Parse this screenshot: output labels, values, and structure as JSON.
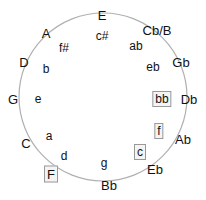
{
  "diagram": {
    "circle": {
      "cx": 103,
      "cy": 97,
      "r": 84,
      "stroke": "#b0b0b0"
    },
    "major_keys": [
      {
        "label": "E",
        "x": 102,
        "y": 15,
        "boxed": false
      },
      {
        "label": "Cb/B",
        "x": 157,
        "y": 30,
        "boxed": false
      },
      {
        "label": "Gb",
        "x": 181,
        "y": 62,
        "boxed": false
      },
      {
        "label": "Db",
        "x": 189,
        "y": 99,
        "boxed": false
      },
      {
        "label": "Ab",
        "x": 183,
        "y": 139,
        "boxed": false
      },
      {
        "label": "Eb",
        "x": 155,
        "y": 169,
        "boxed": false
      },
      {
        "label": "Bb",
        "x": 109,
        "y": 185,
        "boxed": false
      },
      {
        "label": "F",
        "x": 51,
        "y": 174,
        "boxed": true
      },
      {
        "label": "C",
        "x": 26,
        "y": 143,
        "boxed": false
      },
      {
        "label": "G",
        "x": 13,
        "y": 99,
        "boxed": false
      },
      {
        "label": "D",
        "x": 24,
        "y": 62,
        "boxed": false
      },
      {
        "label": "A",
        "x": 46,
        "y": 33,
        "boxed": false
      }
    ],
    "minor_keys": [
      {
        "label": "c#",
        "x": 102,
        "y": 36,
        "boxed": false
      },
      {
        "label": "ab",
        "x": 136,
        "y": 46,
        "boxed": false
      },
      {
        "label": "eb",
        "x": 153,
        "y": 67,
        "boxed": false
      },
      {
        "label": "bb",
        "x": 162,
        "y": 99,
        "boxed": true
      },
      {
        "label": "f",
        "x": 159,
        "y": 131,
        "boxed": true
      },
      {
        "label": "c",
        "x": 140,
        "y": 152,
        "boxed": true
      },
      {
        "label": "g",
        "x": 104,
        "y": 163,
        "boxed": false
      },
      {
        "label": "d",
        "x": 64,
        "y": 156,
        "boxed": false
      },
      {
        "label": "a",
        "x": 49,
        "y": 136,
        "boxed": false
      },
      {
        "label": "e",
        "x": 38,
        "y": 99,
        "boxed": false
      },
      {
        "label": "b",
        "x": 46,
        "y": 69,
        "boxed": false
      },
      {
        "label": "f#",
        "x": 64,
        "y": 48,
        "boxed": false
      }
    ]
  }
}
